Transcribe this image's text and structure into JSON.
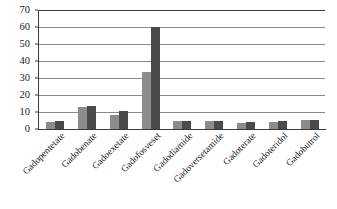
{
  "chart_data": {
    "type": "bar",
    "title": "",
    "subtitle": "",
    "xlabel": "",
    "ylabel": "",
    "ylim": [
      0,
      70
    ],
    "yticks": [
      0,
      10,
      20,
      30,
      40,
      50,
      60,
      70
    ],
    "grid": true,
    "legend": "none",
    "categories": [
      "Gadopentetate",
      "Gadobenate",
      "Gadoexetate",
      "Gadofosveset",
      "Gadodiamide",
      "Gadoversetamide",
      "Gadoterate",
      "Gadoteridol",
      "Gadobutrol"
    ],
    "series": [
      {
        "name": "Series 1",
        "color": "#8c8c8c",
        "values": [
          4,
          13,
          8,
          33.5,
          4.5,
          4.5,
          3.5,
          4,
          5.5
        ]
      },
      {
        "name": "Series 2",
        "color": "#4a4a4a",
        "values": [
          4.5,
          13.5,
          10.5,
          60,
          5,
          5,
          4,
          4.5,
          5.5
        ]
      }
    ]
  },
  "colors": {
    "series_a": "#8c8c8c",
    "series_b": "#4a4a4a",
    "axis": "#3a3a3a",
    "gridline": "#8a8a8a",
    "background": "#ffffff"
  }
}
